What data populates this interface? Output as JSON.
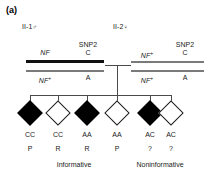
{
  "figure": {
    "panel_letter": "(a)",
    "background_color": "#ffffff"
  },
  "parents": [
    {
      "id": "II-1",
      "sex_symbol": "♂",
      "sex": "male",
      "haplotypes": [
        {
          "locus_label": "NF",
          "locus_superscript": "",
          "snp_label": "SNP2",
          "allele": "C",
          "bar_style": "thick-black",
          "bar_color": "#111111"
        },
        {
          "locus_label": "NF",
          "locus_superscript": "+",
          "snp_label": "",
          "allele": "A",
          "bar_style": "thin-gray",
          "bar_color": "#7a7a7a"
        }
      ]
    },
    {
      "id": "II-2",
      "sex_symbol": "♀",
      "sex": "female",
      "haplotypes": [
        {
          "locus_label": "NF",
          "locus_superscript": "+",
          "snp_label": "SNP2",
          "allele": "C",
          "bar_style": "thin-gray",
          "bar_color": "#7a7a7a"
        },
        {
          "locus_label": "NF",
          "locus_superscript": "+",
          "snp_label": "",
          "allele": "A",
          "bar_style": "thin-gray",
          "bar_color": "#7a7a7a"
        }
      ]
    }
  ],
  "children": [
    {
      "shape": "diamond",
      "status": "affected",
      "genotype": "CC",
      "phase": "P"
    },
    {
      "shape": "diamond",
      "status": "unaffected",
      "genotype": "CC",
      "phase": "R"
    },
    {
      "shape": "diamond",
      "status": "affected",
      "genotype": "AA",
      "phase": "R"
    },
    {
      "shape": "diamond",
      "status": "unaffected",
      "genotype": "AA",
      "phase": "P"
    },
    {
      "shape": "diamond",
      "status": "affected",
      "genotype": "AC",
      "phase": "?"
    },
    {
      "shape": "diamond",
      "status": "unaffected",
      "genotype": "AC",
      "phase": "?"
    }
  ],
  "group_labels": {
    "left": "Informative",
    "right": "Noninformative"
  }
}
